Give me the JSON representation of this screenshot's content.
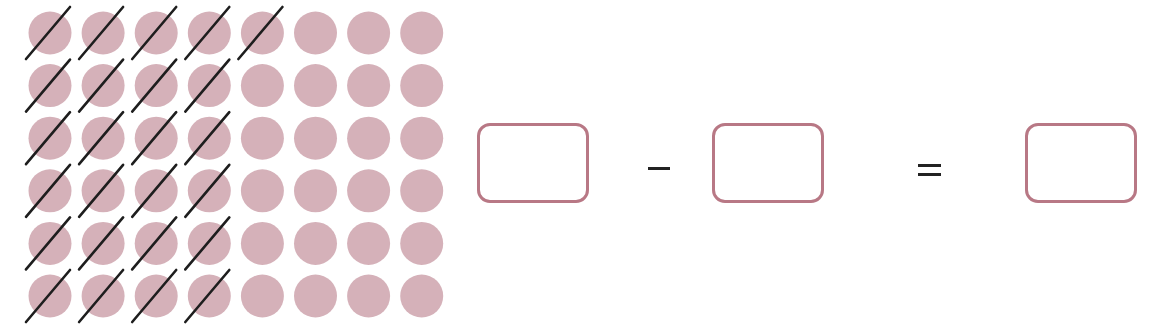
{
  "figure": {
    "dot_color": "#d5b1b9",
    "cross_color": "#1e1e1e",
    "box_border_color": "#b87885",
    "grid": {
      "rows": 6,
      "columns": 8,
      "crossed_per_row": [
        5,
        4,
        4,
        4,
        4,
        4
      ],
      "total_dots": 48,
      "total_crossed": 25
    }
  },
  "equation": {
    "box1_value": "",
    "operator": "−",
    "box2_value": "",
    "equals": "=",
    "result_value": ""
  }
}
